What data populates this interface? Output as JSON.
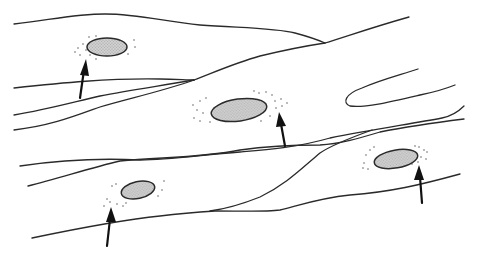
{
  "diagram": {
    "type": "cell-illustration",
    "colors": {
      "background": "#ffffff",
      "outline": "#2a2a2a",
      "nucleus_fill": "#c8c8c8",
      "arrow": "#111111"
    },
    "nuclei": [
      {
        "id": 1,
        "cx": 107,
        "cy": 47,
        "rx": 20,
        "ry": 9,
        "rotate": 0
      },
      {
        "id": 2,
        "cx": 239,
        "cy": 110,
        "rx": 28,
        "ry": 11,
        "rotate": -8
      },
      {
        "id": 3,
        "cx": 138,
        "cy": 190,
        "rx": 17,
        "ry": 8.5,
        "rotate": -12
      },
      {
        "id": 4,
        "cx": 396,
        "cy": 159,
        "rx": 22,
        "ry": 9,
        "rotate": -10
      }
    ],
    "arrows": [
      {
        "points_to": 1,
        "x1": 80,
        "y1": 98,
        "x2": 86,
        "y2": 59
      },
      {
        "points_to": 2,
        "x1": 285,
        "y1": 146,
        "x2": 279,
        "y2": 112
      },
      {
        "points_to": 3,
        "x1": 107,
        "y1": 246,
        "x2": 111,
        "y2": 207
      },
      {
        "points_to": 4,
        "x1": 422,
        "y1": 203,
        "x2": 419,
        "y2": 165
      }
    ],
    "labels": []
  }
}
